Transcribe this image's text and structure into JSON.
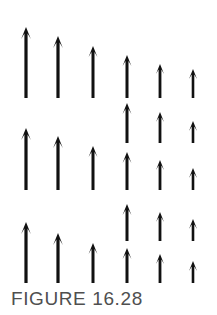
{
  "figure": {
    "caption": "FIGURE 16.28",
    "caption_color": "#4f4f4f",
    "background_color": "#ffffff",
    "arrow_color": "#111111",
    "width": 217,
    "height": 315
  },
  "diagram": {
    "type": "vector-array",
    "columns": 6,
    "bands": 3,
    "column_x": [
      26,
      58,
      93,
      127,
      160,
      193
    ],
    "arrows": [
      {
        "name": "arrow-r1c1",
        "x": 26,
        "tip_y": 27,
        "base_y": 98,
        "width": 3.2,
        "head": 12
      },
      {
        "name": "arrow-r1c2",
        "x": 58,
        "tip_y": 36,
        "base_y": 98,
        "width": 3.2,
        "head": 12
      },
      {
        "name": "arrow-r1c3",
        "x": 93,
        "tip_y": 46,
        "base_y": 98,
        "width": 3.0,
        "head": 11
      },
      {
        "name": "arrow-r1c4",
        "x": 127,
        "tip_y": 55,
        "base_y": 98,
        "width": 3.0,
        "head": 11
      },
      {
        "name": "arrow-r1c5",
        "x": 160,
        "tip_y": 64,
        "base_y": 98,
        "width": 2.8,
        "head": 10
      },
      {
        "name": "arrow-r1c6",
        "x": 193,
        "tip_y": 69,
        "base_y": 98,
        "width": 2.6,
        "head": 10
      },
      {
        "name": "arrow-r2c4-upper",
        "x": 127,
        "tip_y": 103,
        "base_y": 143,
        "width": 3.0,
        "head": 11
      },
      {
        "name": "arrow-r2c5-upper",
        "x": 160,
        "tip_y": 112,
        "base_y": 143,
        "width": 2.8,
        "head": 10
      },
      {
        "name": "arrow-r2c6-upper",
        "x": 193,
        "tip_y": 121,
        "base_y": 143,
        "width": 2.6,
        "head": 10
      },
      {
        "name": "arrow-r2c1",
        "x": 26,
        "tip_y": 128,
        "base_y": 190,
        "width": 3.2,
        "head": 12
      },
      {
        "name": "arrow-r2c2",
        "x": 58,
        "tip_y": 136,
        "base_y": 190,
        "width": 3.2,
        "head": 12
      },
      {
        "name": "arrow-r2c3",
        "x": 93,
        "tip_y": 146,
        "base_y": 190,
        "width": 3.0,
        "head": 11
      },
      {
        "name": "arrow-r2c4-lower",
        "x": 127,
        "tip_y": 152,
        "base_y": 190,
        "width": 3.0,
        "head": 11
      },
      {
        "name": "arrow-r2c5-lower",
        "x": 160,
        "tip_y": 160,
        "base_y": 190,
        "width": 2.8,
        "head": 10
      },
      {
        "name": "arrow-r2c6-lower",
        "x": 193,
        "tip_y": 168,
        "base_y": 190,
        "width": 2.6,
        "head": 10
      },
      {
        "name": "arrow-r3c4-upper",
        "x": 127,
        "tip_y": 204,
        "base_y": 241,
        "width": 3.0,
        "head": 11
      },
      {
        "name": "arrow-r3c5-upper",
        "x": 160,
        "tip_y": 212,
        "base_y": 241,
        "width": 2.8,
        "head": 10
      },
      {
        "name": "arrow-r3c6-upper",
        "x": 193,
        "tip_y": 219,
        "base_y": 241,
        "width": 2.6,
        "head": 10
      },
      {
        "name": "arrow-r3c1",
        "x": 26,
        "tip_y": 222,
        "base_y": 283,
        "width": 3.2,
        "head": 12
      },
      {
        "name": "arrow-r3c2",
        "x": 58,
        "tip_y": 233,
        "base_y": 283,
        "width": 3.2,
        "head": 12
      },
      {
        "name": "arrow-r3c3",
        "x": 93,
        "tip_y": 243,
        "base_y": 283,
        "width": 3.0,
        "head": 11
      },
      {
        "name": "arrow-r3c4-lower",
        "x": 127,
        "tip_y": 248,
        "base_y": 283,
        "width": 3.0,
        "head": 11
      },
      {
        "name": "arrow-r3c5-lower",
        "x": 160,
        "tip_y": 254,
        "base_y": 283,
        "width": 2.8,
        "head": 10
      },
      {
        "name": "arrow-r3c6-lower",
        "x": 193,
        "tip_y": 261,
        "base_y": 283,
        "width": 2.6,
        "head": 10
      }
    ]
  }
}
